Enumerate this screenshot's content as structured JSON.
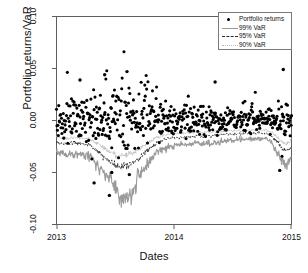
{
  "chart_data": {
    "type": "scatter",
    "title": "",
    "xlabel": "Dates",
    "ylabel": "Portfolio returns/VaR",
    "xlim": [
      2013.0,
      2015.0
    ],
    "ylim": [
      -0.1,
      0.1
    ],
    "grid": false,
    "legend_position": "top-right",
    "xticks": [
      {
        "value": 2013,
        "label": "2013"
      },
      {
        "value": 2014,
        "label": "2014"
      },
      {
        "value": 2015,
        "label": "2015"
      }
    ],
    "yticks": [
      {
        "value": 0.1,
        "label": "0.10"
      },
      {
        "value": 0.05,
        "label": "0.05"
      },
      {
        "value": 0.0,
        "label": "0.00"
      },
      {
        "value": -0.05,
        "label": "-0.05"
      },
      {
        "value": -0.1,
        "label": "-0.10"
      }
    ],
    "series": [
      {
        "name": "Portfolio returns",
        "type": "scatter",
        "marker": "filled-circle",
        "color": "#000000",
        "n_points": 520,
        "mean": 0.0005,
        "sd": 0.0105,
        "notable_outliers": [
          {
            "x": 2013.32,
            "y": -0.06
          },
          {
            "x": 2013.45,
            "y": -0.072
          },
          {
            "x": 2013.47,
            "y": -0.05
          },
          {
            "x": 2013.62,
            "y": -0.052
          },
          {
            "x": 2013.2,
            "y": 0.039
          },
          {
            "x": 2013.41,
            "y": 0.044
          },
          {
            "x": 2013.6,
            "y": 0.047
          },
          {
            "x": 2014.35,
            "y": 0.037
          },
          {
            "x": 2014.93,
            "y": 0.049
          },
          {
            "x": 2014.9,
            "y": -0.048
          }
        ]
      },
      {
        "name": "99% VaR",
        "type": "line",
        "style": "solid",
        "color": "#9a9a9a",
        "description": "Lowest band; near -0.030 at start, drops to about -0.065 mid-2013, rises steadily to about -0.022 by late 2014, then falls to about -0.045 at the end."
      },
      {
        "name": "95% VaR",
        "type": "line",
        "style": "dashed",
        "color": "#2b2b2b",
        "description": "Middle band; near -0.022 at start, dips to about -0.040 mid-2013, recovers to about -0.016 by late 2014, then falls to about -0.030 at the end."
      },
      {
        "name": "90% VaR",
        "type": "line",
        "style": "dotted",
        "color": "#bdbdbd",
        "description": "Highest (shallowest) band; hugs just above the 95% VaR line throughout, near -0.018 at start and about -0.013 by late 2014."
      }
    ]
  },
  "legend": {
    "items": [
      {
        "label": "Portfolio returns",
        "key": "point"
      },
      {
        "label": "99% VaR",
        "key": "solid"
      },
      {
        "label": "95% VaR",
        "key": "dashed"
      },
      {
        "label": "90% VaR",
        "key": "dotted"
      }
    ]
  },
  "colors": {
    "axis": "#5f5f5f",
    "point": "#000000",
    "var99": "#9a9a9a",
    "var95": "#2b2b2b",
    "var90": "#bdbdbd",
    "background": "#ffffff"
  }
}
